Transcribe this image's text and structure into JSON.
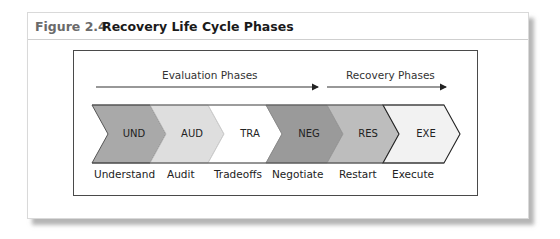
{
  "figure": {
    "number": "Figure 2.4",
    "title": "Recovery Life Cycle Phases"
  },
  "groups": [
    {
      "label": "Evaluation Phases"
    },
    {
      "label": "Recovery Phases"
    }
  ],
  "phases": [
    {
      "abbr": "UND",
      "name": "Understand",
      "color": "#a9a9a9"
    },
    {
      "abbr": "AUD",
      "name": "Audit",
      "color": "#dedede"
    },
    {
      "abbr": "TRA",
      "name": "Tradeoffs",
      "color": "#ffffff"
    },
    {
      "abbr": "NEG",
      "name": "Negotiate",
      "color": "#9a9a9a"
    },
    {
      "abbr": "RES",
      "name": "Restart",
      "color": "#bdbdbd"
    },
    {
      "abbr": "EXE",
      "name": "Execute",
      "color": "#f2f2f2"
    }
  ]
}
